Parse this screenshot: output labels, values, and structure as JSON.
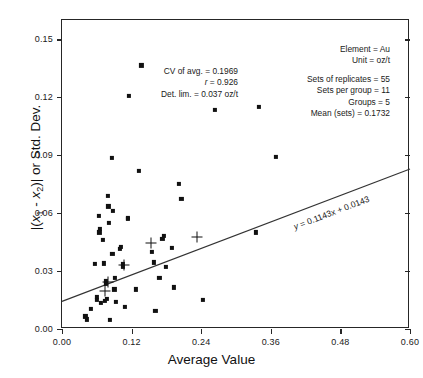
{
  "chart_data": {
    "type": "scatter",
    "title": "",
    "xlabel": "Average Value",
    "ylabel": "|(x1 - x2)| or Std. Dev.",
    "xlim": [
      0.0,
      0.6
    ],
    "ylim": [
      0.0,
      0.16
    ],
    "xticks": [
      "0.00",
      "0.12",
      "0.24",
      "0.36",
      "0.48",
      "0.60"
    ],
    "xtick_values": [
      0.0,
      0.12,
      0.24,
      0.36,
      0.48,
      0.6
    ],
    "yticks": [
      "0.00",
      "0.03",
      "0.06",
      "0.09",
      "0.12",
      "0.15"
    ],
    "ytick_values": [
      0.0,
      0.03,
      0.06,
      0.09,
      0.12,
      0.15
    ],
    "grid": false,
    "legend": null,
    "series": [
      {
        "name": "replicate pairs",
        "marker": "square",
        "color": "#111111",
        "points": [
          [
            0.0405,
            0.0065
          ],
          [
            0.0435,
            0.005
          ],
          [
            0.0505,
            0.0105
          ],
          [
            0.0565,
            0.0335
          ],
          [
            0.0595,
            0.015
          ],
          [
            0.0605,
            0.0165
          ],
          [
            0.0635,
            0.0585
          ],
          [
            0.0645,
            0.05
          ],
          [
            0.0655,
            0.052
          ],
          [
            0.0675,
            0.0135
          ],
          [
            0.07,
            0.046
          ],
          [
            0.0725,
            0.034
          ],
          [
            0.074,
            0.0145
          ],
          [
            0.0755,
            0.0235
          ],
          [
            0.076,
            0.025
          ],
          [
            0.078,
            0.0155
          ],
          [
            0.079,
            0.069
          ],
          [
            0.08,
            0.0635
          ],
          [
            0.0805,
            0.055
          ],
          [
            0.0825,
            0.0047
          ],
          [
            0.0855,
            0.0885
          ],
          [
            0.087,
            0.039
          ],
          [
            0.088,
            0.061
          ],
          [
            0.0905,
            0.0205
          ],
          [
            0.0915,
            0.0265
          ],
          [
            0.0925,
            0.014
          ],
          [
            0.1,
            0.0415
          ],
          [
            0.101,
            0.0425
          ],
          [
            0.105,
            0.032
          ],
          [
            0.1055,
            0.0335
          ],
          [
            0.108,
            0.0115
          ],
          [
            0.113,
            0.0575
          ],
          [
            0.114,
            0.057
          ],
          [
            0.115,
            0.1205
          ],
          [
            0.127,
            0.0205
          ],
          [
            0.132,
            0.082
          ],
          [
            0.137,
            0.1365
          ],
          [
            0.1555,
            0.04
          ],
          [
            0.158,
            0.0345
          ],
          [
            0.161,
            0.0095
          ],
          [
            0.168,
            0.0265
          ],
          [
            0.173,
            0.0465
          ],
          [
            0.176,
            0.048
          ],
          [
            0.1785,
            0.032
          ],
          [
            0.19,
            0.042
          ],
          [
            0.193,
            0.0215
          ],
          [
            0.202,
            0.075
          ],
          [
            0.206,
            0.0675
          ],
          [
            0.243,
            0.015
          ],
          [
            0.264,
            0.1135
          ],
          [
            0.335,
            0.05
          ],
          [
            0.339,
            0.115
          ],
          [
            0.369,
            0.089
          ]
        ]
      },
      {
        "name": "group means",
        "marker": "plus",
        "color": "#111111",
        "points": [
          [
            0.0745,
            0.0195
          ],
          [
            0.0785,
            0.0243
          ],
          [
            0.1068,
            0.033
          ],
          [
            0.153,
            0.0447
          ],
          [
            0.232,
            0.0477
          ]
        ]
      }
    ],
    "fit_line": {
      "equation": "y = 0.1143x + 0.0143",
      "slope": 0.1143,
      "intercept": 0.0143,
      "x_start": 0.0,
      "x_end": 0.6
    }
  },
  "annotations": {
    "left_block": [
      "CV of avg. = 0.1969",
      "r = 0.926",
      "Det. lim. = 0.037 oz/t"
    ],
    "left_block_parts": {
      "cv_label": "CV of avg. = 0.1969",
      "r_symbol": "r",
      "r_value": " = 0.926",
      "det_lim": "Det. lim. = 0.037 oz/t"
    },
    "right_block": {
      "element": "Element = Au",
      "unit": "Unit = oz/t",
      "sets_of_replicates": "Sets of replicates = 55",
      "sets_per_group": "Sets per group = 11",
      "groups": "Groups = 5",
      "mean_sets": "Mean (sets) = 0.1732"
    },
    "equation_parts": {
      "y_symbol": "y",
      "rest": " = 0.1143x + 0.0143"
    }
  },
  "axis": {
    "xlabel": "Average Value",
    "ylabel_prefix": "|(",
    "ylabel_x1": "x",
    "ylabel_sub1": "1",
    "ylabel_minus": " - ",
    "ylabel_x2": "x",
    "ylabel_sub2": "2",
    "ylabel_suffix": ")| or Std. Dev."
  },
  "style": {
    "marker_color": "#111111",
    "axis_color": "#262626",
    "background": "#ffffff"
  }
}
